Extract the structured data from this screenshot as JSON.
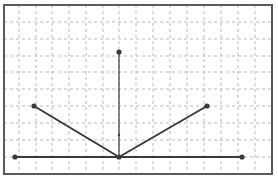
{
  "diagram": {
    "type": "geometric-figure-on-grid",
    "frame": {
      "x1": 4,
      "y1": 5,
      "x2": 272,
      "y2": 174,
      "stroke": "#5a5a5a",
      "stroke_width": 2
    },
    "grid": {
      "stroke": "#b9b9b9",
      "dash": "3,3",
      "vertical_x": [
        19,
        36,
        52,
        69,
        86,
        103,
        119,
        136,
        153,
        170,
        187,
        204,
        221,
        238,
        255
      ],
      "horizontal_y": [
        22,
        39,
        56,
        72,
        89,
        106,
        123,
        140,
        157
      ]
    },
    "line_color": "#3a3a3a",
    "points": [
      {
        "name": "top-point",
        "x": 119,
        "y": 52,
        "r": 2.6
      },
      {
        "name": "vertex-point",
        "x": 119,
        "y": 157,
        "r": 2.6
      },
      {
        "name": "left-arm-end-point",
        "x": 34,
        "y": 106,
        "r": 2.6
      },
      {
        "name": "right-arm-end-point",
        "x": 207,
        "y": 106,
        "r": 2.6
      },
      {
        "name": "baseline-left-point",
        "x": 15,
        "y": 157,
        "r": 2.6
      },
      {
        "name": "baseline-right-point",
        "x": 242,
        "y": 157,
        "r": 2.6
      },
      {
        "name": "small-mark-point",
        "x": 119,
        "y": 135,
        "r": 1.2
      }
    ],
    "segments": [
      {
        "name": "vertical-segment",
        "x1": 119,
        "y1": 52,
        "x2": 119,
        "y2": 157,
        "width": 1.2
      },
      {
        "name": "left-arm-segment",
        "x1": 34,
        "y1": 106,
        "x2": 119,
        "y2": 157,
        "width": 2
      },
      {
        "name": "right-arm-segment",
        "x1": 119,
        "y1": 157,
        "x2": 207,
        "y2": 106,
        "width": 2
      },
      {
        "name": "baseline-segment",
        "x1": 15,
        "y1": 157,
        "x2": 242,
        "y2": 157,
        "width": 2
      }
    ]
  }
}
